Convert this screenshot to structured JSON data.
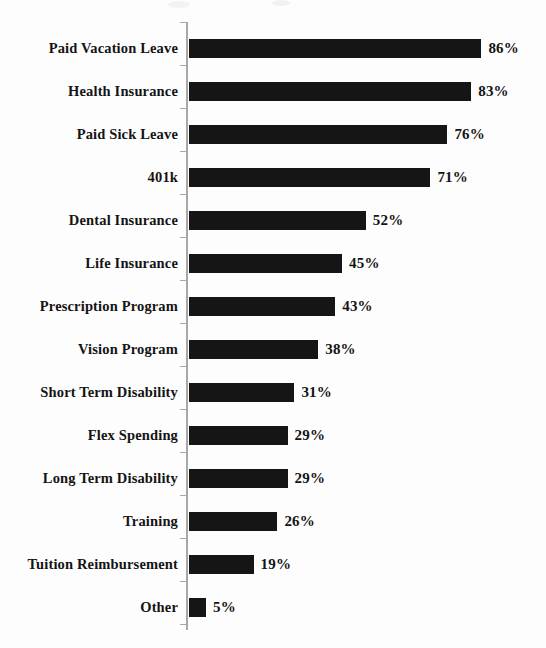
{
  "chart_data": {
    "type": "bar",
    "orientation": "horizontal",
    "title": "",
    "subtitle": "",
    "xlabel": "",
    "ylabel": "",
    "xlim": [
      0,
      100
    ],
    "grid": false,
    "legend": null,
    "value_suffix": "%",
    "categories": [
      "Paid Vacation Leave",
      "Health Insurance",
      "Paid Sick Leave",
      "401k",
      "Dental Insurance",
      "Life Insurance",
      "Prescription Program",
      "Vision Program",
      "Short Term Disability",
      "Flex Spending",
      "Long Term Disability",
      "Training",
      "Tuition Reimbursement",
      "Other"
    ],
    "values": [
      86,
      83,
      76,
      71,
      52,
      45,
      43,
      38,
      31,
      29,
      29,
      26,
      19,
      5
    ],
    "value_labels": [
      "86%",
      "83%",
      "76%",
      "71%",
      "52%",
      "45%",
      "43%",
      "38%",
      "31%",
      "29%",
      "29%",
      "26%",
      "19%",
      "5%"
    ],
    "bar_color": "#151515",
    "axis_color": "#a8a8a8",
    "background_color": "#fdfdfd",
    "text_color": "#141414"
  }
}
